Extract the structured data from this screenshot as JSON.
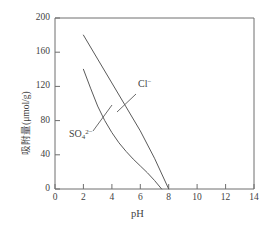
{
  "chart_data": {
    "type": "line",
    "title": "",
    "xlabel": "pH",
    "ylabel": "吸附量(μmol/g)",
    "xlim": [
      0,
      14
    ],
    "ylim": [
      0,
      200
    ],
    "xticks": [
      0,
      2,
      4,
      6,
      8,
      10,
      12,
      14
    ],
    "yticks": [
      0,
      40,
      80,
      120,
      160,
      200
    ],
    "grid": false,
    "legend_position": "inline-annotations",
    "series": [
      {
        "name": "Cl⁻",
        "label_html": "Cl<sup>−</sup>",
        "color": "#5a5a5a",
        "x": [
          2.0,
          3.0,
          4.0,
          5.0,
          6.0,
          7.0,
          8.0
        ],
        "y": [
          180,
          152,
          124,
          96,
          68,
          36,
          0
        ]
      },
      {
        "name": "SO₄²⁻",
        "label_html": "SO<sub>4</sub><sup>2−</sup>",
        "color": "#5a5a5a",
        "x": [
          2.0,
          2.5,
          3.0,
          3.5,
          4.0,
          4.5,
          5.0,
          5.5,
          6.0,
          6.5,
          7.0,
          7.5
        ],
        "y": [
          140,
          118,
          97,
          80,
          66,
          54,
          44,
          35,
          27,
          19,
          10,
          0
        ]
      }
    ],
    "annotations": [
      {
        "name": "cl-label",
        "text": "Cl⁻",
        "x_px": 138,
        "y_px": 82,
        "leader_from_px": [
          136,
          94
        ],
        "leader_to_px": [
          117,
          112
        ]
      },
      {
        "name": "so4-label",
        "text": "SO₄²⁻",
        "x_px": 69,
        "y_px": 128,
        "leader_from_px": [
          93,
          131
        ],
        "leader_to_px": [
          112,
          105
        ]
      }
    ]
  },
  "axis": {
    "x_tick_labels": [
      "0",
      "2",
      "4",
      "6",
      "8",
      "10",
      "12",
      "14"
    ],
    "y_tick_labels": [
      "0",
      "40",
      "80",
      "120",
      "160",
      "200"
    ],
    "x_title": "pH",
    "y_title": "吸附量(μmol/g)"
  },
  "series_labels": {
    "cl": "Cl",
    "cl_charge": "−",
    "so4": "SO",
    "so4_sub": "4",
    "so4_charge": "2−"
  }
}
